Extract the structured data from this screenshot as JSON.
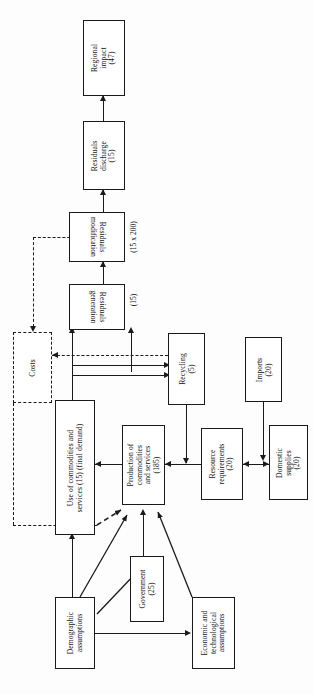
{
  "figure": {
    "orientation": "rotated-90-ccw",
    "nodes": [
      {
        "id": "regional_impact",
        "label": "Regional\nimpact\n(47)",
        "style": "solid"
      },
      {
        "id": "residuals_discharge",
        "label": "Residuals\ndischarge\n(15)",
        "style": "solid"
      },
      {
        "id": "residuals_modification",
        "label": "Residuals\nmodification",
        "style": "solid",
        "caption": "(15 x 200)"
      },
      {
        "id": "residuals_generation",
        "label": "Residuals\ngeneration",
        "style": "solid",
        "caption": "(15)"
      },
      {
        "id": "costs",
        "label": "Costs",
        "style": "dashed"
      },
      {
        "id": "use_of_commodities",
        "label": "Use of commodities and\nservices (15) (final demand)",
        "style": "solid"
      },
      {
        "id": "production",
        "label": "Production of\ncommodities\nand services\n(185)",
        "style": "solid"
      },
      {
        "id": "recycling",
        "label": "Recycling\n(5)",
        "style": "solid"
      },
      {
        "id": "resource_requirements",
        "label": "Resource\nrequirements\n(20)",
        "style": "solid"
      },
      {
        "id": "imports",
        "label": "Imports\n(20)",
        "style": "solid"
      },
      {
        "id": "domestic_supplies",
        "label": "Domestic\nsupplies\n(20)",
        "style": "solid"
      },
      {
        "id": "government",
        "label": "Government\n(25)",
        "style": "solid"
      },
      {
        "id": "demographic",
        "label": "Demographic\nassumptions",
        "style": "solid"
      },
      {
        "id": "economic_tech",
        "label": "Economic and\ntechnological\nassumptions",
        "style": "solid"
      }
    ],
    "edges": [
      {
        "from": "residuals_discharge",
        "to": "regional_impact",
        "kind": "solid"
      },
      {
        "from": "residuals_modification",
        "to": "residuals_discharge",
        "kind": "solid"
      },
      {
        "from": "residuals_generation",
        "to": "residuals_modification",
        "kind": "solid"
      },
      {
        "from": "residuals_modification",
        "to": "costs",
        "kind": "dashed"
      },
      {
        "from": "costs",
        "to": "use_of_commodities",
        "kind": "dashed"
      },
      {
        "from": "recycling",
        "to": "costs",
        "kind": "dashed"
      },
      {
        "from": "use_of_commodities",
        "to": "residuals_generation",
        "kind": "solid"
      },
      {
        "from": "recycling",
        "to": "residuals_generation",
        "kind": "solid"
      },
      {
        "from": "production",
        "to": "recycling",
        "kind": "solid"
      },
      {
        "from": "recycling",
        "to": "production",
        "kind": "solid"
      },
      {
        "from": "production",
        "to": "use_of_commodities",
        "kind": "solid"
      },
      {
        "from": "resource_requirements",
        "to": "production",
        "kind": "solid"
      },
      {
        "from": "domestic_supplies",
        "to": "resource_requirements",
        "kind": "solid"
      },
      {
        "from": "imports",
        "to": "resource_requirements",
        "kind": "solid"
      },
      {
        "from": "demographic",
        "to": "use_of_commodities",
        "kind": "solid"
      },
      {
        "from": "demographic",
        "to": "production",
        "kind": "solid"
      },
      {
        "from": "demographic",
        "to": "government",
        "kind": "solid"
      },
      {
        "from": "demographic",
        "to": "economic_tech",
        "kind": "solid"
      },
      {
        "from": "government",
        "to": "production",
        "kind": "solid"
      },
      {
        "from": "economic_tech",
        "to": "production",
        "kind": "solid"
      },
      {
        "from": "costs",
        "to": "production",
        "kind": "dashed"
      }
    ],
    "colors": {
      "stroke": "#1a1a1a",
      "fill": "#ffffff",
      "background": "#ffffff"
    }
  }
}
